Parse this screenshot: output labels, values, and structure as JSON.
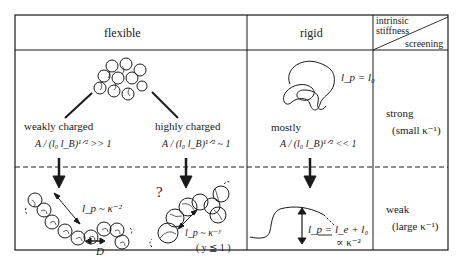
{
  "header": {
    "flexible": "flexible",
    "rigid": "rigid",
    "corner_top_line1": "intrinsic",
    "corner_top_line2": "stiffness",
    "corner_bottom": "screening"
  },
  "rows": {
    "strong": {
      "label": "strong",
      "sub": "(small κ⁻¹)"
    },
    "weak": {
      "label": "weak",
      "sub": "(large κ⁻¹)"
    }
  },
  "flexible": {
    "weak_label": "weakly charged",
    "weak_condition": "A / (l₀ l_B)¹ᐟ² >> 1",
    "high_label": "highly charged",
    "high_condition": "A / (l₀ l_B)¹ᐟ² ~ 1",
    "weak_result": "l_p ~ κ⁻²",
    "weak_blob_size": "D",
    "high_question": "?",
    "high_result": "l_p ~ κ⁻ʸ",
    "high_note": "( y ≦ 1 )"
  },
  "rigid": {
    "strong_relation": "l_p = l₀",
    "strong_label": "mostly",
    "strong_condition": "A / (l₀ l_B)¹ᐟ² << 1",
    "weak_relation": "l_p = l_e + l₀",
    "weak_scaling": "∝ κ⁻²"
  },
  "colors": {
    "line": "#1a1a1a",
    "background": "#ffffff"
  }
}
